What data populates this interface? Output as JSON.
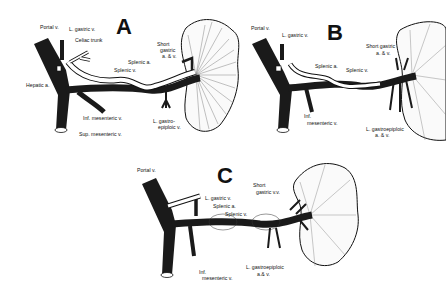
{
  "figure": {
    "panels": [
      {
        "id": "A",
        "letter": "A",
        "labels": {
          "portal_v": "Portal v.",
          "l_gastric_v": "L. gastric v.",
          "celiac_trunk": "Celiac trunk",
          "hepatic_a": "Hepatic a.",
          "splenic_v": "Splenic v.",
          "splenic_a": "Splenic a.",
          "short_gastric": "Short gastric a. & v.",
          "short_gastric_l1": "Short",
          "short_gastric_l2": "gastric",
          "short_gastric_l3": "a. & v.",
          "inf_mesenteric_v": "Inf. mesenteric v.",
          "sup_mesenteric_v": "Sup. mesenteric v.",
          "l_gastroepiploic_l1": "L. gastro-",
          "l_gastroepiploic_l2": "epiploic v."
        }
      },
      {
        "id": "B",
        "letter": "B",
        "labels": {
          "portal_v": "Portal v.",
          "l_gastric_v": "L. gastric v.",
          "splenic_a": "Splenic a.",
          "splenic_v": "Splenic v.",
          "short_gastric_l1": "Short gastric",
          "short_gastric_l2": "a. & v.",
          "inf_mesenteric_l1": "Inf.",
          "inf_mesenteric_l2": "mesenteric v.",
          "l_gastroepiploic_l1": "L. gastroepiploic",
          "l_gastroepiploic_l2": "a. & v."
        }
      },
      {
        "id": "C",
        "letter": "C",
        "labels": {
          "portal_v": "Portal v.",
          "l_gastric_v": "L. gastric v.",
          "splenic_a": "Splenic a.",
          "splenic_v": "Splenic v.",
          "short_gastric_l1": "Short",
          "short_gastric_l2": "gastric v.v.",
          "inf_mesenteric_l1": "Inf.",
          "inf_mesenteric_l2": "mesenteric v.",
          "l_gastroepiploic_l1": "L. gastroepiploic",
          "l_gastroepiploic_l2": "a.& v."
        }
      }
    ],
    "colors": {
      "vein": "#1a1a1a",
      "artery": "#ffffff",
      "outline": "#111111",
      "background": "#ffffff"
    }
  }
}
